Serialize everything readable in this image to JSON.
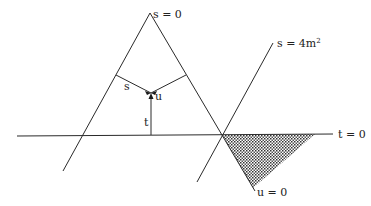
{
  "diagram": {
    "type": "mandelstam-plane",
    "labels": {
      "s_zero": "s = 0",
      "s_threshold": "s = 4m",
      "s_threshold_exp": "2",
      "t_zero": "t = 0",
      "u_zero": "u = 0",
      "s_var": "s",
      "t_var": "t",
      "u_var": "u"
    },
    "colors": {
      "line": "#2a2a2a",
      "shade_dot": "#333333",
      "background": "#ffffff"
    },
    "lines": {
      "t_zero_line": {
        "x1": 17,
        "y1": 136,
        "x2": 333,
        "y2": 134
      },
      "s_zero_left": {
        "x1": 150,
        "y1": 13,
        "x2": 63,
        "y2": 171
      },
      "s_zero_right": {
        "x1": 150,
        "y1": 13,
        "x2": 255,
        "y2": 191
      },
      "s_threshold_line": {
        "x1": 273,
        "y1": 43,
        "x2": 197,
        "y2": 182
      },
      "perp_s": {
        "x1": 116,
        "y1": 75,
        "x2": 151,
        "y2": 93
      },
      "perp_u": {
        "x1": 186,
        "y1": 75,
        "x2": 151,
        "y2": 93
      },
      "perp_t": {
        "x1": 151,
        "y1": 135,
        "x2": 151,
        "y2": 95
      }
    },
    "shaded_region": {
      "points": "222,135 315,134 253,188"
    }
  }
}
